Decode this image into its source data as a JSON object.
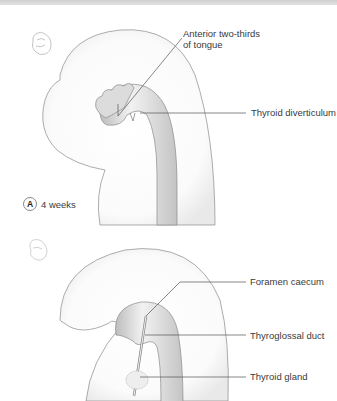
{
  "figure": {
    "panels": [
      {
        "id": "A",
        "caption": "4 weeks",
        "labels": {
          "anterior_tongue_line1": "Anterior two-thirds",
          "anterior_tongue_line2": "of tongue",
          "thyroid_diverticulum": "Thyroid diverticulum"
        }
      },
      {
        "id": "B",
        "labels": {
          "foramen_caecum": "Foramen caecum",
          "thyroglossal_duct": "Thyroglossal duct",
          "thyroid_gland": "Thyroid gland"
        }
      }
    ],
    "colors": {
      "outline": "#8a8a8a",
      "leader_line": "#555555",
      "tissue_fill": "#e6e6e6",
      "text": "#3a3a3a"
    }
  }
}
